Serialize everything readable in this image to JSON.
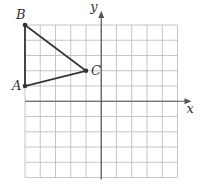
{
  "figure": {
    "grid": {
      "xmin": -5,
      "xmax": 5,
      "ymin": -5,
      "ymax": 5,
      "step": 1,
      "color": "#b8b8b8"
    },
    "axes": {
      "x_label": "x",
      "y_label": "y",
      "color": "#555555"
    },
    "triangle": {
      "color": "#333333",
      "vertices": [
        {
          "name": "A",
          "x": -5,
          "y": 1
        },
        {
          "name": "B",
          "x": -5,
          "y": 5
        },
        {
          "name": "C",
          "x": -1,
          "y": 2
        }
      ]
    }
  }
}
